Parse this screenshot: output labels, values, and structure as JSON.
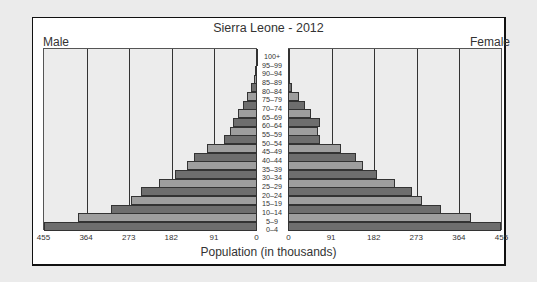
{
  "chart_data": {
    "type": "bar",
    "subtype": "population-pyramid",
    "title": "Sierra Leone - 2012",
    "xlabel": "Population (in thousands)",
    "ylabel": "",
    "left_label": "Male",
    "right_label": "Female",
    "xlim": [
      0,
      455
    ],
    "x_ticks_left": [
      "455",
      "364",
      "273",
      "182",
      "91",
      "0"
    ],
    "x_ticks_right": [
      "0",
      "91",
      "182",
      "273",
      "364",
      "455"
    ],
    "grid": true,
    "categories": [
      "100+",
      "95-99",
      "90-94",
      "85-89",
      "80-84",
      "75-79",
      "70-74",
      "65-69",
      "60-64",
      "55-59",
      "50-54",
      "45-49",
      "40-44",
      "35-39",
      "30-34",
      "25-29",
      "20-24",
      "15-19",
      "10-14",
      "5-9",
      "0-4"
    ],
    "series": [
      {
        "name": "Male",
        "values": [
          1,
          2,
          4,
          6,
          13,
          21,
          30,
          41,
          51,
          58,
          71,
          107,
          135,
          150,
          175,
          209,
          248,
          269,
          312,
          382,
          455
        ]
      },
      {
        "name": "Female",
        "values": [
          1,
          2,
          2,
          3,
          9,
          24,
          36,
          49,
          68,
          64,
          68,
          113,
          145,
          160,
          190,
          229,
          265,
          286,
          327,
          391,
          455
        ]
      }
    ],
    "colors": {
      "dark": "#6e6e6e",
      "light": "#9e9e9e",
      "plot_bg": "#ececec"
    }
  }
}
